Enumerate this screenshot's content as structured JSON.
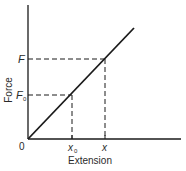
{
  "diagram": {
    "type": "force-extension graph",
    "axes": {
      "y_label": "Force",
      "x_label": "Extension",
      "origin_label": "0"
    },
    "y_ticks": [
      {
        "label": "F",
        "sub": ""
      },
      {
        "label": "F",
        "sub": "0"
      }
    ],
    "x_ticks": [
      {
        "label": "x",
        "sub": "0"
      },
      {
        "label": "x",
        "sub": ""
      }
    ],
    "line": {
      "description": "straight line through origin (proportional)"
    },
    "colors": {
      "ink": "#1a1a1a",
      "background": "#ffffff"
    }
  }
}
